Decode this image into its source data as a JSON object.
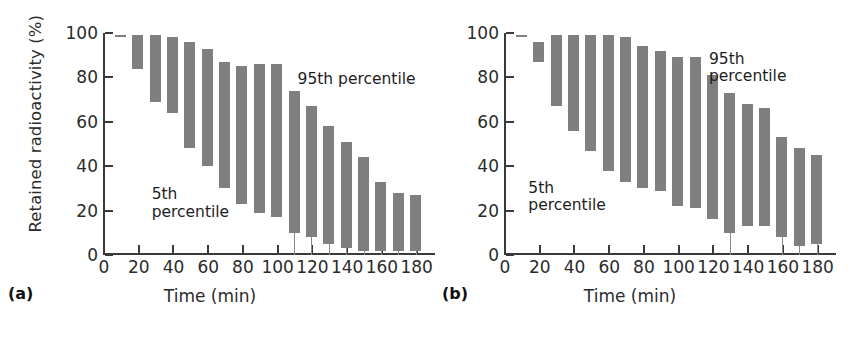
{
  "figure": {
    "background_color": "#ffffff",
    "bar_color": "#7f7f7f",
    "axis_color": "#3a3a3a",
    "text_color": "#2b2b2b"
  },
  "panels": [
    {
      "tag": "(a)",
      "ylabel": "Retained radioactivity (%)",
      "xlabel": "Time (min)",
      "annotation_high": "95th percentile",
      "annotation_low": "5th\npercentile"
    },
    {
      "tag": "(b)",
      "ylabel": "",
      "xlabel": "Time (min)",
      "annotation_high": "95th\npercentile",
      "annotation_low": "5th\npercentile"
    }
  ],
  "chart_data": [
    {
      "type": "bar",
      "panel": "(a)",
      "title": "",
      "xlabel": "Time (min)",
      "ylabel": "Retained radioactivity (%)",
      "xlim": [
        0,
        190
      ],
      "ylim": [
        0,
        100
      ],
      "xticks": [
        0,
        20,
        40,
        60,
        80,
        100,
        120,
        140,
        160,
        180
      ],
      "xtick_labels": [
        "0",
        "20",
        "40",
        "60",
        "80",
        "100",
        "120",
        "140",
        "160",
        "180"
      ],
      "yticks": [
        0,
        20,
        40,
        60,
        80,
        100
      ],
      "ytick_labels": [
        "0",
        "20",
        "40",
        "60",
        "80",
        "100"
      ],
      "grid": false,
      "legend": "none",
      "bar_style": "floating range bars (5th to 95th percentile)",
      "x": [
        10,
        20,
        30,
        40,
        50,
        60,
        70,
        80,
        90,
        100,
        110,
        120,
        130,
        140,
        150,
        160,
        170,
        180
      ],
      "series": [
        {
          "name": "95th percentile",
          "values": [
            99,
            99,
            99,
            98,
            96,
            93,
            87,
            85,
            86,
            86,
            74,
            67,
            58,
            51,
            44,
            33,
            28,
            27
          ]
        },
        {
          "name": "5th percentile",
          "values": [
            99,
            84,
            69,
            64,
            48,
            40,
            30,
            23,
            19,
            17,
            10,
            8,
            5,
            3,
            2,
            2,
            2,
            2
          ]
        }
      ],
      "annotations": [
        {
          "text": "95th percentile",
          "x": 112,
          "y": 83
        },
        {
          "text": "5th percentile",
          "x": 28,
          "y": 31
        }
      ]
    },
    {
      "type": "bar",
      "panel": "(b)",
      "title": "",
      "xlabel": "Time (min)",
      "ylabel": "",
      "xlim": [
        0,
        190
      ],
      "ylim": [
        0,
        100
      ],
      "xticks": [
        0,
        20,
        40,
        60,
        80,
        100,
        120,
        140,
        160,
        180
      ],
      "xtick_labels": [
        "0",
        "20",
        "40",
        "60",
        "80",
        "100",
        "120",
        "140",
        "160",
        "180"
      ],
      "yticks": [
        0,
        20,
        40,
        60,
        80,
        100
      ],
      "ytick_labels": [
        "0",
        "20",
        "40",
        "60",
        "80",
        "100"
      ],
      "grid": false,
      "legend": "none",
      "bar_style": "floating range bars (5th to 95th percentile)",
      "x": [
        10,
        20,
        30,
        40,
        50,
        60,
        70,
        80,
        90,
        100,
        110,
        120,
        130,
        140,
        150,
        160,
        170,
        180
      ],
      "series": [
        {
          "name": "95th percentile",
          "values": [
            99,
            96,
            99,
            99,
            99,
            99,
            98,
            94,
            92,
            89,
            89,
            81,
            73,
            68,
            66,
            53,
            48,
            45
          ]
        },
        {
          "name": "5th percentile",
          "values": [
            99,
            87,
            67,
            56,
            47,
            38,
            33,
            30,
            29,
            22,
            21,
            16,
            10,
            13,
            13,
            8,
            4,
            5
          ]
        }
      ],
      "annotations": [
        {
          "text": "95th percentile",
          "x": 118,
          "y": 92
        },
        {
          "text": "5th percentile",
          "x": 14,
          "y": 34
        }
      ]
    }
  ]
}
